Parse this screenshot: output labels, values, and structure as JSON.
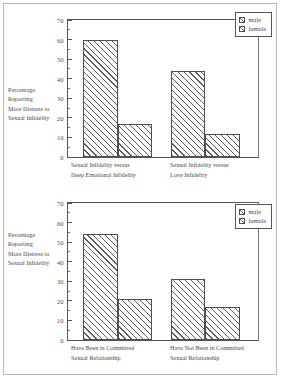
{
  "charts": [
    {
      "id": "top",
      "ylabel_lines": [
        "Percentage",
        "Reporting",
        "More Distress to",
        "Sexual Infidelity"
      ],
      "legend": {
        "male": "male",
        "female": "female"
      },
      "categories": [
        {
          "lines": [
            "Sexual Infidelity versus",
            "Deep Emotional Infidelity"
          ]
        },
        {
          "lines": [
            "Sexual Infidelity versus",
            "Love Infidelity"
          ]
        }
      ],
      "yticks": [
        "0",
        "10",
        "20",
        "30",
        "40",
        "50",
        "60",
        "70"
      ]
    },
    {
      "id": "bottom",
      "ylabel_lines": [
        "Percentage",
        "Reporting",
        "More Distress to",
        "Sexual Infidelity"
      ],
      "legend": {
        "male": "male",
        "female": "female"
      },
      "categories": [
        {
          "lines": [
            "Have Been in Committed",
            "Sexual Relationship"
          ]
        },
        {
          "lines": [
            "Have Not Been in Committed",
            "Sexual Relationship"
          ]
        }
      ],
      "yticks": [
        "0",
        "10",
        "20",
        "30",
        "40",
        "50",
        "60",
        "70"
      ]
    }
  ],
  "chart_data": [
    {
      "type": "bar",
      "title": "",
      "xlabel": "",
      "ylabel": "Percentage Reporting More Distress to Sexual Infidelity",
      "ylim": [
        0,
        70
      ],
      "ytick_step": 10,
      "grid": false,
      "legend_position": "top-right",
      "categories": [
        "Sexual Infidelity versus Deep Emotional Infidelity",
        "Sexual Infidelity versus Love Infidelity"
      ],
      "series": [
        {
          "name": "male",
          "values": [
            60,
            44
          ]
        },
        {
          "name": "female",
          "values": [
            17,
            12
          ]
        }
      ]
    },
    {
      "type": "bar",
      "title": "",
      "xlabel": "",
      "ylabel": "Percentage Reporting More Distress to Sexual Infidelity",
      "ylim": [
        0,
        70
      ],
      "ytick_step": 10,
      "grid": false,
      "legend_position": "top-right",
      "categories": [
        "Have Been in Committed Sexual Relationship",
        "Have Not Been in Committed Sexual Relationship"
      ],
      "series": [
        {
          "name": "male",
          "values": [
            54,
            31
          ]
        },
        {
          "name": "female",
          "values": [
            21,
            17
          ]
        }
      ]
    }
  ],
  "colors": {
    "axis": "#555555",
    "hatch": "#5a5a5a",
    "text": "#4a4a4a",
    "background": "#ffffff",
    "page_border": "#b9b9b9"
  }
}
